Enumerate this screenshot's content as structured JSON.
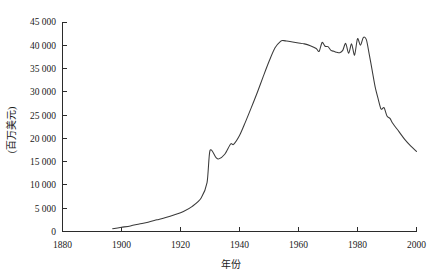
{
  "chart_data": {
    "type": "line",
    "title": "",
    "xlabel": "年份",
    "ylabel": "(百万美元)",
    "xlim": [
      1880,
      2000
    ],
    "ylim": [
      0,
      45000
    ],
    "grid": false,
    "legend": null,
    "xticks": [
      "1880",
      "1900",
      "1920",
      "1940",
      "1960",
      "1980",
      "2000"
    ],
    "xtick_values": [
      1880,
      1900,
      1920,
      1940,
      1960,
      1980,
      2000
    ],
    "yticks": [
      "0",
      "5 000",
      "10 000",
      "15 000",
      "20 000",
      "25 000",
      "30 000",
      "35 000",
      "40 000",
      "45 000"
    ],
    "ytick_values": [
      0,
      5000,
      10000,
      15000,
      20000,
      25000,
      30000,
      35000,
      40000,
      45000
    ],
    "series": [
      {
        "name": "",
        "color": "#3a3a3a",
        "x": [
          1897,
          1900,
          1903,
          1906,
          1909,
          1912,
          1915,
          1918,
          1921,
          1924,
          1927,
          1929,
          1930,
          1932,
          1933,
          1935,
          1937,
          1938,
          1940,
          1942,
          1944,
          1946,
          1948,
          1950,
          1952,
          1954,
          1955,
          1956,
          1958,
          1960,
          1962,
          1964,
          1966,
          1967,
          1968,
          1969,
          1970,
          1971,
          1972,
          1973,
          1974,
          1975,
          1976,
          1977,
          1978,
          1979,
          1980,
          1981,
          1982,
          1983,
          1984,
          1985,
          1986,
          1987,
          1988,
          1989,
          1990,
          1991,
          1992,
          1994,
          1996,
          1998,
          2000
        ],
        "y": [
          600,
          900,
          1200,
          1600,
          2000,
          2500,
          3000,
          3600,
          4300,
          5400,
          7200,
          10500,
          17400,
          15900,
          15600,
          16600,
          18800,
          18700,
          20600,
          23500,
          26600,
          29800,
          33200,
          36500,
          39400,
          40900,
          41000,
          40900,
          40700,
          40500,
          40300,
          39900,
          39300,
          38700,
          40600,
          39800,
          39700,
          38900,
          38700,
          38500,
          38400,
          38900,
          40400,
          38300,
          40300,
          37900,
          41400,
          40000,
          41700,
          41200,
          38000,
          34500,
          31000,
          28500,
          26300,
          26600,
          24800,
          24300,
          23200,
          21500,
          19800,
          18400,
          17200
        ]
      }
    ]
  }
}
